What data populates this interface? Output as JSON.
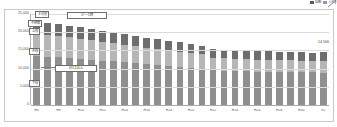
{
  "legend": {
    "items": [
      {
        "swatch": "#5a5a5a",
        "label": "総数"
      },
      {
        "swatch": "#9a9a9a",
        "label": "うち"
      }
    ],
    "arrow_icon": "arrow-up-right-icon"
  },
  "callouts": [
    {
      "name": "callout-top",
      "label": "その他"
    },
    {
      "name": "callout-second",
      "label": "不明等"
    },
    {
      "name": "callout-third",
      "label": "上段"
    },
    {
      "name": "callout-fourth",
      "label": "中段"
    },
    {
      "name": "callout-right",
      "label": "ピーク時"
    },
    {
      "name": "callout-middle",
      "label": "約5,110人"
    },
    {
      "name": "callout-lower",
      "label": "下段"
    }
  ],
  "end_value_label": "14,506",
  "chart_data": {
    "type": "bar",
    "title": "",
    "subtitle": "",
    "xlabel": "",
    "ylabel": "",
    "ylim": [
      0,
      25000
    ],
    "grid": true,
    "legend_position": "top-right",
    "ytick_labels": [
      "25,000",
      "20,000",
      "15,000",
      "10,000",
      "5,000",
      "0"
    ],
    "ytick_values": [
      25000,
      20000,
      15000,
      10000,
      5000,
      0
    ],
    "categories": [
      "H6",
      "",
      "H8",
      "",
      "H10",
      "",
      "H12",
      "",
      "H14",
      "",
      "H16",
      "",
      "H18",
      "",
      "H20",
      "",
      "H22",
      "",
      "H24",
      "",
      "H26",
      "",
      "H28",
      "",
      "H30",
      "",
      "R2"
    ],
    "series": [
      {
        "name": "下段",
        "color": "#8f8f8f",
        "values": [
          13500,
          13300,
          13100,
          12900,
          12700,
          12400,
          12200,
          12000,
          11700,
          11500,
          11200,
          11000,
          10700,
          10500,
          10200,
          10000,
          9500,
          9400,
          9300,
          9250,
          9200,
          9150,
          9100,
          9050,
          9000,
          8950,
          8900
        ]
      },
      {
        "name": "中段",
        "color": "#b6b6b6",
        "values": [
          6000,
          5900,
          5800,
          5700,
          5500,
          5400,
          5200,
          5100,
          4900,
          4800,
          4600,
          4500,
          4300,
          4200,
          4000,
          3900,
          3500,
          3450,
          3400,
          3350,
          3300,
          3280,
          3250,
          3220,
          3200,
          3180,
          3150
        ]
      },
      {
        "name": "上段",
        "color": "#6e6e6e",
        "values": [
          3500,
          3400,
          3300,
          3200,
          3100,
          3000,
          2900,
          2850,
          2800,
          2750,
          2700,
          2650,
          2600,
          2550,
          2500,
          2450,
          2400,
          2380,
          2360,
          2340,
          2320,
          2300,
          2290,
          2280,
          2270,
          2260,
          2456
        ]
      }
    ],
    "totals": [
      23000,
      22600,
      22200,
      21800,
      21300,
      20800,
      20300,
      19950,
      19400,
      19050,
      18500,
      18150,
      17600,
      17250,
      16700,
      16350,
      15400,
      15230,
      15060,
      14940,
      14820,
      14730,
      14640,
      14550,
      14470,
      14390,
      14506
    ],
    "peak_value": 23000,
    "end_value": 14506
  }
}
